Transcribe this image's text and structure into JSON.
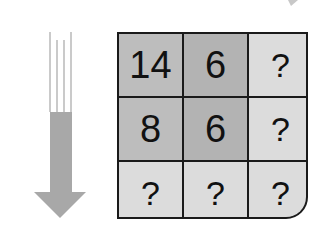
{
  "puzzle": {
    "grid": {
      "rows": [
        [
          {
            "value": "14",
            "shade": "#bdbdbd"
          },
          {
            "value": "6",
            "shade": "#b3b3b3"
          },
          {
            "value": "?",
            "shade": "#dcdcdc"
          }
        ],
        [
          {
            "value": "8",
            "shade": "#bdbdbd"
          },
          {
            "value": "6",
            "shade": "#b3b3b3"
          },
          {
            "value": "?",
            "shade": "#dcdcdc"
          }
        ],
        [
          {
            "value": "?",
            "shade": "#dcdcdc"
          },
          {
            "value": "?",
            "shade": "#dcdcdc"
          },
          {
            "value": "?",
            "shade": "#dcdcdc"
          }
        ]
      ]
    },
    "arrow": {
      "direction": "down",
      "icon": "down-arrow-icon",
      "color": "#a8a8a8"
    },
    "colors": {
      "grid_line": "#1a1a1a",
      "text": "#111111",
      "background": "#ffffff"
    }
  }
}
